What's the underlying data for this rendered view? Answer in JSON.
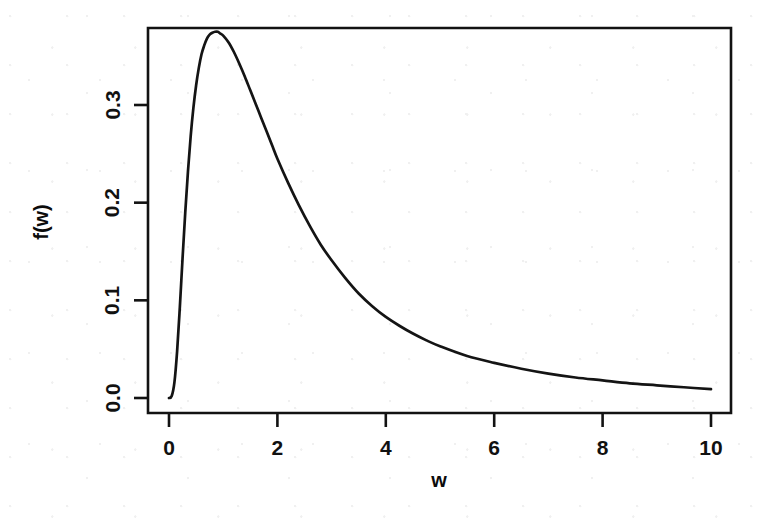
{
  "chart_data": {
    "type": "line",
    "title": "",
    "subtitle": "",
    "xlabel": "w",
    "ylabel": "f(w)",
    "xlim": [
      -0.3,
      10.3
    ],
    "ylim": [
      -0.008,
      0.392
    ],
    "grid": false,
    "legend": null,
    "xticks": [
      "0",
      "2",
      "4",
      "6",
      "8",
      "10"
    ],
    "xtick_values": [
      0,
      2,
      4,
      6,
      8,
      10
    ],
    "yticks": [
      "0.0",
      "0.1",
      "0.2",
      "0.3"
    ],
    "ytick_values": [
      0.0,
      0.1,
      0.2,
      0.3
    ],
    "annotations": [],
    "series": [
      {
        "name": "f(w)",
        "color": "#141414",
        "peak": {
          "x": 0.9,
          "y": 0.375
        },
        "x": [
          0.0,
          0.05,
          0.1,
          0.15,
          0.2,
          0.25,
          0.3,
          0.35,
          0.4,
          0.45,
          0.5,
          0.55,
          0.6,
          0.65,
          0.7,
          0.75,
          0.8,
          0.85,
          0.9,
          0.95,
          1.0,
          1.1,
          1.2,
          1.3,
          1.4,
          1.5,
          1.6,
          1.7,
          1.8,
          1.9,
          2.0,
          2.2,
          2.4,
          2.6,
          2.8,
          3.0,
          3.25,
          3.5,
          3.75,
          4.0,
          4.25,
          4.5,
          4.75,
          5.0,
          5.5,
          6.0,
          6.5,
          7.0,
          7.5,
          8.0,
          8.5,
          9.0,
          9.5,
          10.0
        ],
        "y": [
          0.0,
          0.002,
          0.016,
          0.048,
          0.093,
          0.143,
          0.19,
          0.232,
          0.268,
          0.297,
          0.32,
          0.338,
          0.352,
          0.361,
          0.368,
          0.372,
          0.374,
          0.375,
          0.375,
          0.373,
          0.371,
          0.364,
          0.354,
          0.342,
          0.329,
          0.315,
          0.301,
          0.287,
          0.273,
          0.259,
          0.245,
          0.22,
          0.197,
          0.176,
          0.157,
          0.141,
          0.123,
          0.107,
          0.094,
          0.083,
          0.074,
          0.066,
          0.059,
          0.053,
          0.043,
          0.036,
          0.03,
          0.025,
          0.021,
          0.018,
          0.015,
          0.013,
          0.011,
          0.009
        ]
      }
    ]
  },
  "figure": {
    "xlabel": "w",
    "ylabel": "f(w)"
  }
}
